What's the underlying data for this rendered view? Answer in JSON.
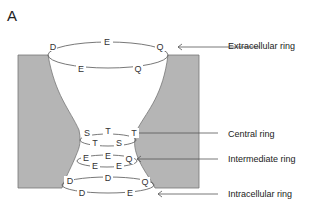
{
  "panel_label": "A",
  "ring_labels": {
    "extracellular": "Extracellular ring",
    "central": "Central ring",
    "intermediate": "Intermediate ring",
    "intracellular": "Intracellular ring"
  },
  "residues": {
    "extracellular_back": [
      "D",
      "E",
      "Q"
    ],
    "extracellular_front": [
      "E",
      "Q"
    ],
    "central_back": [
      "S",
      "T",
      "T"
    ],
    "central_front": [
      "T",
      "S"
    ],
    "intermediate_back": [
      "E",
      "E",
      "Q"
    ],
    "intermediate_front": [
      "E",
      "E"
    ],
    "intracellular_back": [
      "D",
      "D",
      "Q"
    ],
    "intracellular_front": [
      "D",
      "E"
    ]
  },
  "colors": {
    "membrane": "#b5b5b5",
    "line": "#555555"
  }
}
